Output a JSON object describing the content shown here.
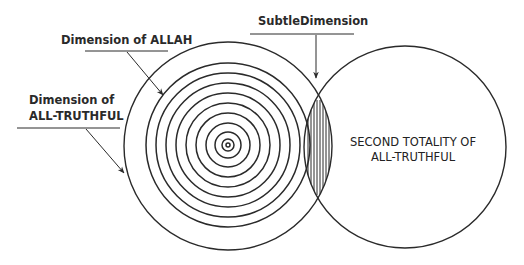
{
  "labels": {
    "allah": "Dimension of ALLAH",
    "truthful_line1": "Dimension of",
    "truthful_line2": "ALL-TRUTHFUL",
    "subtle": "SubtleDimension",
    "second_line1": "SECOND TOTALITY OF",
    "second_line2": "ALL-TRUTHFUL"
  },
  "geometry": {
    "left_circle": {
      "cx": 228,
      "cy": 146,
      "r": 104
    },
    "right_circle": {
      "cx": 405,
      "cy": 147,
      "r": 101
    },
    "concentric_radii": [
      2,
      6,
      13,
      22,
      32,
      42,
      52,
      62,
      72,
      82
    ],
    "stroke_color": "#2a2a2a"
  }
}
